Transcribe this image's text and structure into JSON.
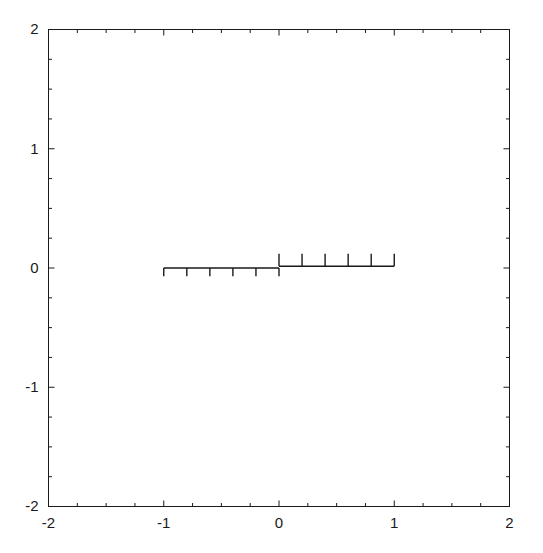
{
  "chart_data": {
    "type": "line",
    "title": "",
    "xlabel": "",
    "ylabel": "",
    "xlim": [
      -2,
      2
    ],
    "ylim": [
      -2,
      2
    ],
    "grid": false,
    "legend": null,
    "background_color": "#ffffff",
    "line_color": "#1a1a1a",
    "frame_color": "#1a1a1a",
    "xticks": [
      -2,
      -1,
      0,
      1,
      2
    ],
    "xtick_labels": [
      "-2",
      "-1",
      "0",
      "1",
      "2"
    ],
    "yticks": [
      -2,
      -1,
      0,
      1,
      2
    ],
    "ytick_labels": [
      "-2",
      "-1",
      "0",
      "1",
      "2"
    ],
    "x_minor_tick_interval": 0.25,
    "y_minor_tick_interval": 0.25,
    "series": [
      {
        "name": "left-comb-baseline",
        "kind": "segment",
        "x": [
          -1.0,
          0.0
        ],
        "y": [
          0.0,
          0.0
        ]
      },
      {
        "name": "left-comb-teeth",
        "kind": "stems-down",
        "baseline_y": 0.0,
        "tooth_length": -0.07,
        "x": [
          -1.0,
          -0.8,
          -0.6,
          -0.4,
          -0.2,
          0.0
        ],
        "y": [
          -0.07,
          -0.07,
          -0.07,
          -0.07,
          -0.07,
          -0.07
        ]
      },
      {
        "name": "right-comb-baseline",
        "kind": "segment",
        "x": [
          0.0,
          1.0
        ],
        "y": [
          0.015,
          0.015
        ]
      },
      {
        "name": "right-comb-teeth",
        "kind": "stems-up",
        "baseline_y": 0.015,
        "tooth_length": 0.105,
        "x": [
          0.0,
          0.2,
          0.4,
          0.6,
          0.8,
          1.0
        ],
        "y": [
          0.12,
          0.12,
          0.12,
          0.12,
          0.12,
          0.12
        ]
      }
    ]
  }
}
